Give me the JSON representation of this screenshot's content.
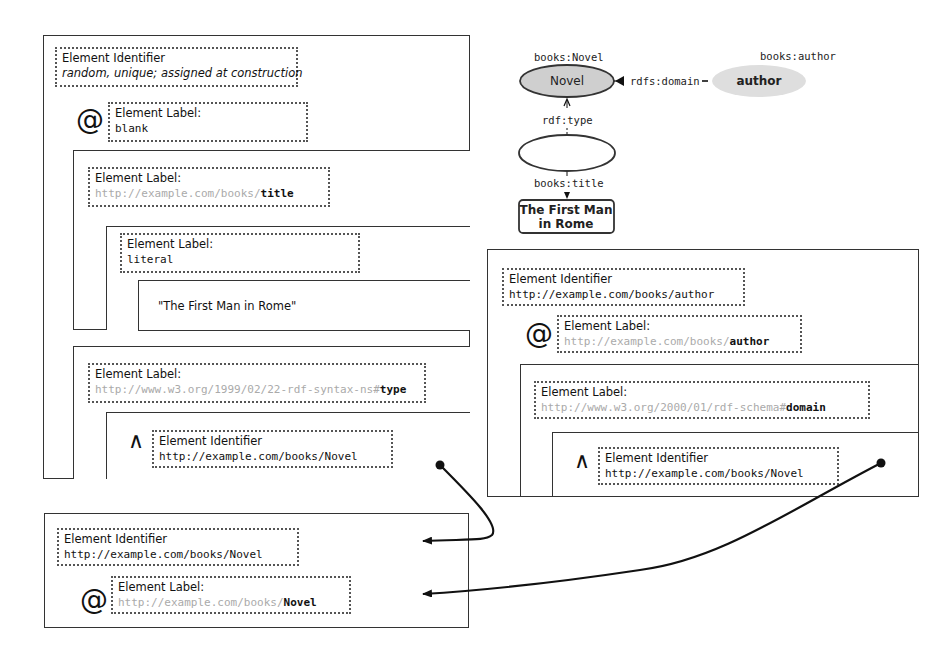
{
  "left_panel": {
    "identifier_heading": "Element Identifier",
    "identifier_value": "random, unique; assigned at construction",
    "at_symbol": "@",
    "label_heading": "Element Label:",
    "label_value": "blank",
    "title_box": {
      "label_heading": "Element Label:",
      "label_prefix": "http://example.com/books/",
      "label_suffix": "title",
      "literal_box": {
        "label_heading": "Element Label:",
        "label_value": "literal",
        "value_box": {
          "text": "\"The First Man in Rome\""
        }
      }
    },
    "type_box": {
      "label_heading": "Element Label:",
      "label_prefix": "http://www.w3.org/1999/02/22-rdf-syntax-ns#",
      "label_suffix": "type",
      "ref_box": {
        "caret_symbol": "∧",
        "identifier_heading": "Element Identifier",
        "identifier_value": "http://example.com/books/Novel"
      }
    }
  },
  "right_panel": {
    "identifier_heading": "Element Identifier",
    "identifier_value": "http://example.com/books/author",
    "at_symbol": "@",
    "label_heading": "Element Label:",
    "label_prefix": "http://example.com/books/",
    "label_suffix": "author",
    "domain_box": {
      "label_heading": "Element Label:",
      "label_prefix": "http://www.w3.org/2000/01/rdf-schema#",
      "label_suffix": "domain",
      "ref_box": {
        "caret_symbol": "∧",
        "identifier_heading": "Element Identifier",
        "identifier_value": "http://example.com/books/Novel"
      }
    }
  },
  "bottom_panel": {
    "identifier_heading": "Element Identifier",
    "identifier_value": "http://example.com/books/Novel",
    "at_symbol": "@",
    "label_heading": "Element Label:",
    "label_prefix": "http://example.com/books/",
    "label_suffix": "Novel"
  },
  "graph": {
    "novel_uri": "books:Novel",
    "novel_node": "Novel",
    "author_uri": "books:author",
    "author_node": "author",
    "domain_edge": "rdfs:domain",
    "type_edge": "rdf:type",
    "title_edge": "books:title",
    "literal_line1": "The First Man",
    "literal_line2": "in Rome",
    "colors": {
      "novel_fill": "#cfcfcf",
      "author_fill": "#dedede",
      "stroke": "#333333"
    }
  }
}
